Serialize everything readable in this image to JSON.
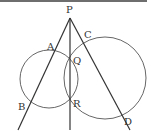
{
  "figure": {
    "type": "geometry",
    "stroke_color": "#333333",
    "circle_color": "#555555",
    "points": [
      {
        "name": "P",
        "label": "P",
        "x": 70,
        "y": 18,
        "lx": 66,
        "ly": 13
      },
      {
        "name": "A",
        "label": "A",
        "x": 57,
        "y": 50,
        "lx": 47,
        "ly": 50
      },
      {
        "name": "B",
        "label": "B",
        "x": 27,
        "y": 103,
        "lx": 18,
        "ly": 110
      },
      {
        "name": "C",
        "label": "C",
        "x": 83,
        "y": 40,
        "lx": 84,
        "ly": 38
      },
      {
        "name": "D",
        "label": "D",
        "x": 122,
        "y": 116,
        "lx": 124,
        "ly": 125
      },
      {
        "name": "Q",
        "label": "Q",
        "x": 70,
        "y": 58,
        "lx": 73,
        "ly": 64
      },
      {
        "name": "R",
        "label": "R",
        "x": 70,
        "y": 99,
        "lx": 73,
        "ly": 107
      }
    ],
    "circles": [
      {
        "name": "left-circle",
        "cx": 49,
        "cy": 79,
        "r": 29
      },
      {
        "name": "right-circle",
        "cx": 105,
        "cy": 78,
        "r": 41
      }
    ],
    "lines": [
      {
        "name": "line-PB",
        "x1": 70,
        "y1": 18,
        "x2": 18,
        "y2": 130
      },
      {
        "name": "line-PR",
        "x1": 70,
        "y1": 18,
        "x2": 70,
        "y2": 130
      },
      {
        "name": "line-PD",
        "x1": 70,
        "y1": 18,
        "x2": 130,
        "y2": 130
      }
    ]
  }
}
